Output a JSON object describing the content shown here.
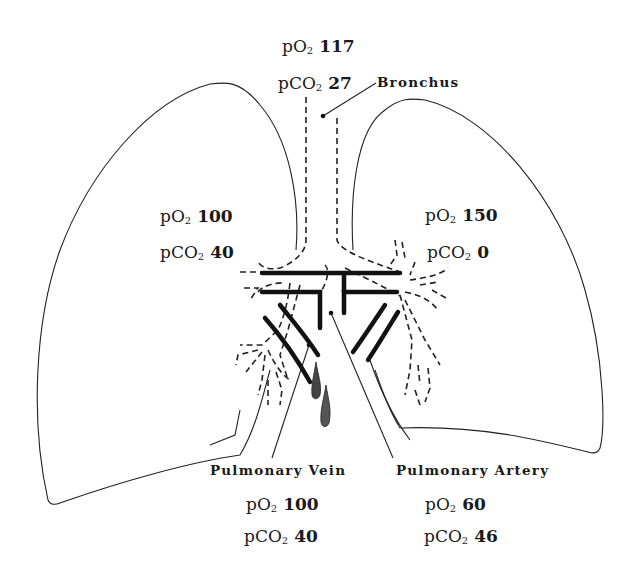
{
  "diagram": {
    "structures": {
      "bronchus": {
        "label": "Bronchus"
      },
      "pulmonary_vein": {
        "label": "Pulmonary Vein"
      },
      "pulmonary_artery": {
        "label": "Pulmonary Artery"
      }
    },
    "gas_readings": {
      "bronchus": {
        "po2": {
          "prefix": "pO",
          "sub": "2",
          "value": "117"
        },
        "pco2": {
          "prefix": "pCO",
          "sub": "2",
          "value": "27"
        }
      },
      "left_lung": {
        "po2": {
          "prefix": "pO",
          "sub": "2",
          "value": "100"
        },
        "pco2": {
          "prefix": "pCO",
          "sub": "2",
          "value": "40"
        }
      },
      "right_lung": {
        "po2": {
          "prefix": "pO",
          "sub": "2",
          "value": "150"
        },
        "pco2": {
          "prefix": "pCO",
          "sub": "2",
          "value": "0"
        }
      },
      "pulmonary_vein": {
        "po2": {
          "prefix": "pO",
          "sub": "2",
          "value": "100"
        },
        "pco2": {
          "prefix": "pCO",
          "sub": "2",
          "value": "40"
        }
      },
      "pulmonary_artery": {
        "po2": {
          "prefix": "pO",
          "sub": "2",
          "value": "60"
        },
        "pco2": {
          "prefix": "pCO",
          "sub": "2",
          "value": "46"
        }
      }
    },
    "colors": {
      "ink": "#1a1a1a",
      "background": "#ffffff"
    }
  }
}
